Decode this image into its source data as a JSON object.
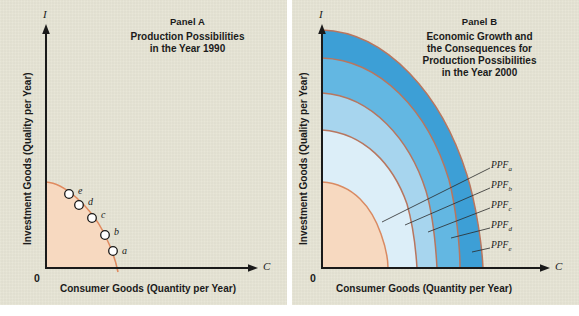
{
  "figure": {
    "background": "#e6e4d4",
    "page_background": "#ffffff",
    "width": 579,
    "height": 316
  },
  "panels": [
    {
      "id": "A",
      "label": "Panel A",
      "title_lines": [
        "Production Possibilities",
        "in the Year 1990"
      ],
      "axes": {
        "y_symbol": "I",
        "x_symbol": "C",
        "origin_label": "0",
        "y_axis_title": "Investment Goods (Quality per Year)",
        "x_axis_title": "Consumer Goods (Quantity per Year)"
      },
      "curve": {
        "name": "PPF 1990",
        "line_color": "#e08a5f",
        "fill_color": "#f7d9c0",
        "y_intercept_px": 182,
        "x_intercept_px": 118
      },
      "points": [
        {
          "label": "a",
          "x_px": 113,
          "y_px": 251,
          "label_dx": 9,
          "label_dy": -3
        },
        {
          "label": "b",
          "x_px": 106,
          "y_px": 236,
          "label_dx": 9,
          "label_dy": -8
        },
        {
          "label": "c",
          "x_px": 93,
          "y_px": 219,
          "label_dx": 9,
          "label_dy": -9
        },
        {
          "label": "d",
          "x_px": 80,
          "y_px": 206,
          "label_dx": 9,
          "label_dy": -9
        },
        {
          "label": "e",
          "x_px": 70,
          "y_px": 195,
          "label_dx": 9,
          "label_dy": -9
        }
      ]
    },
    {
      "id": "B",
      "label": "Panel B",
      "title_lines": [
        "Economic Growth and",
        "the Consequences for",
        "Production Possibilities",
        "in the Year 2000"
      ],
      "axes": {
        "y_symbol": "I",
        "x_symbol": "C",
        "origin_label": "0",
        "y_axis_title": "Investment Goods (Quality per Year)",
        "x_axis_title": "Consumer Goods (Quantity per Year)"
      },
      "curves": [
        {
          "name": "PPFa",
          "label": "PPF",
          "sub": "a",
          "band_color": "#3d9fd6",
          "line_color": "#c07a62",
          "y_intercept_px": 30,
          "x_intercept_px": 196
        },
        {
          "name": "PPFb",
          "label": "PPF",
          "sub": "b",
          "band_color": "#63b7e2",
          "line_color": "#c07a62",
          "y_intercept_px": 58,
          "x_intercept_px": 172
        },
        {
          "name": "PPFc",
          "label": "PPF",
          "sub": "c",
          "band_color": "#a7d5ee",
          "line_color": "#c07a62",
          "y_intercept_px": 93,
          "x_intercept_px": 149
        },
        {
          "name": "PPFd",
          "label": "PPF",
          "sub": "d",
          "band_color": "#dceef8",
          "line_color": "#c07a62",
          "y_intercept_px": 130,
          "x_intercept_px": 129
        },
        {
          "name": "PPFe",
          "label": "PPF",
          "sub": "e",
          "band_color": "#f7d9c0",
          "line_color": "#d98a62",
          "y_intercept_px": 182,
          "x_intercept_px": 98
        }
      ],
      "leader_labels": [
        {
          "label": "PPF",
          "sub": "a",
          "x_px": 203,
          "y_px": 166
        },
        {
          "label": "PPF",
          "sub": "b",
          "x_px": 203,
          "y_px": 186
        },
        {
          "label": "PPF",
          "sub": "c",
          "x_px": 203,
          "y_px": 206
        },
        {
          "label": "PPF",
          "sub": "d",
          "x_px": 203,
          "y_px": 226
        },
        {
          "label": "PPF",
          "sub": "e",
          "x_px": 203,
          "y_px": 246
        }
      ]
    }
  ]
}
